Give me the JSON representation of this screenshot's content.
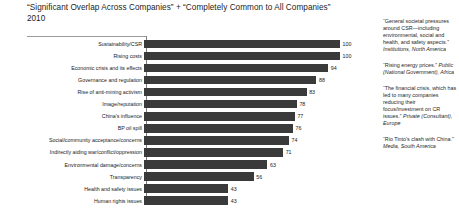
{
  "header": {
    "title": "“Significant Overlap Across Companies” + “Completely Common to All Companies”",
    "subtitle": "2010"
  },
  "chart_data": {
    "type": "bar",
    "orientation": "horizontal",
    "title": "“Significant Overlap Across Companies” + “Completely Common to All Companies”",
    "subtitle": "2010",
    "xlabel": "",
    "ylabel": "",
    "xlim": [
      0,
      100
    ],
    "grid": false,
    "legend": null,
    "categories": [
      "Sustainability/CSR",
      "Rising costs",
      "Economic crisis and its effects",
      "Governance and regulation",
      "Rise of anti-mining activism",
      "Image/reputation",
      "China's influence",
      "BP oil spill",
      "Social/community acceptance/concerns",
      "Indirectly aiding war/conflict/oppression",
      "Environmental damage/concerns",
      "Transparency",
      "Health and safety issues",
      "Human rights issues"
    ],
    "values": [
      100,
      100,
      94,
      88,
      83,
      78,
      77,
      76,
      74,
      71,
      63,
      56,
      43,
      43
    ],
    "bar_color": "#3a3a3a"
  },
  "annotations": [
    {
      "quote": "“General societal pressures around CSR—including environmental, social and health, and safety aspects.” ",
      "source": "Institutions, North America"
    },
    {
      "quote": "“Rising energy prices.” ",
      "source": "Public (National Government), Africa"
    },
    {
      "quote": "“The financial crisis, which has led to many companies reducing their focus/investment on CR issues.” ",
      "source": "Private (Consultant), Europe"
    },
    {
      "quote": "“Rio Tinto's clash with China.” ",
      "source": "Media, South America"
    }
  ]
}
